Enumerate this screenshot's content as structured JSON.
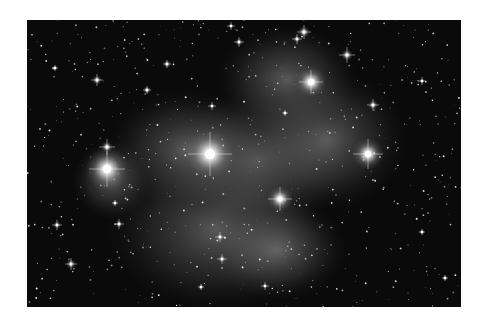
{
  "image": {
    "subject": "star cluster with reflection nebula",
    "palette": {
      "background": "#ffffff",
      "sky": "#0a0a0a",
      "nebula": "#9a9a9a",
      "star": "#ffffff"
    }
  }
}
